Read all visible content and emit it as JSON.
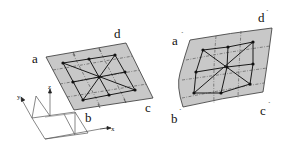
{
  "figure": {
    "colors": {
      "plate_fill": "#c8c8c8",
      "stroke": "#222222",
      "node": "#111111",
      "background": "#ffffff"
    },
    "left_plate": {
      "labels": {
        "a": "a",
        "b": "b",
        "c": "c",
        "d": "d"
      }
    },
    "right_plate": {
      "labels": {
        "a": "a",
        "b": "b",
        "c": "c",
        "d": "d"
      },
      "prime_mark": "´"
    },
    "axes": {
      "x": "x",
      "y": "y",
      "z": "z"
    }
  }
}
